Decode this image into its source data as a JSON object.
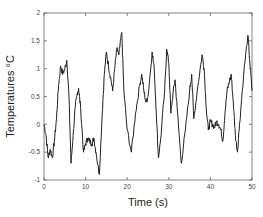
{
  "chart_data": {
    "type": "line",
    "title": "",
    "xlabel": "Time (s)",
    "ylabel": "Temperatures °C",
    "xlim": [
      0,
      50
    ],
    "ylim": [
      -1,
      2
    ],
    "xticks": [
      0,
      10,
      20,
      30,
      40,
      50
    ],
    "yticks": [
      -1,
      -0.5,
      0,
      0.5,
      1,
      1.5,
      2
    ],
    "xtick_labels": [
      "0",
      "10",
      "20",
      "30",
      "40",
      "50"
    ],
    "ytick_labels": [
      "-1",
      "-0.5",
      "0",
      "0.5",
      "1",
      "1.5",
      "2"
    ],
    "grid": false,
    "legend": null,
    "series": [
      {
        "name": "temperature",
        "color": "#222222",
        "x": [
          0,
          0.5,
          1,
          1.5,
          2,
          2.5,
          3,
          3.5,
          4,
          4.5,
          5,
          5.5,
          6,
          6.5,
          7,
          7.5,
          8,
          8.3,
          8.8,
          9.5,
          10,
          10.5,
          11,
          11.5,
          12,
          12.5,
          13.3,
          14,
          14.5,
          15,
          15.5,
          16,
          16.5,
          17,
          17.5,
          18,
          18.7,
          19.2,
          20,
          21,
          22,
          23,
          23.5,
          24,
          24.5,
          25,
          26,
          26.5,
          27,
          27.5,
          28,
          29,
          29.5,
          30,
          30.5,
          31,
          31.5,
          32,
          33,
          34,
          35,
          35.5,
          36,
          37,
          38,
          38.5,
          39,
          39.5,
          40,
          40.5,
          41,
          41.5,
          42,
          42.5,
          43,
          43.5,
          44,
          44.5,
          45,
          45.5,
          46,
          46.5,
          47,
          48,
          49,
          49.5,
          50
        ],
        "values": [
          0.0,
          -0.2,
          -0.6,
          -0.45,
          -0.6,
          -0.3,
          0.1,
          0.7,
          1.05,
          0.9,
          1.0,
          1.15,
          0.5,
          -0.7,
          -0.2,
          0.3,
          0.55,
          0.65,
          0.3,
          -0.5,
          -0.35,
          -0.25,
          -0.3,
          -0.35,
          -0.25,
          -0.5,
          -0.9,
          0.2,
          0.9,
          1.3,
          1.05,
          0.85,
          0.6,
          1.0,
          1.35,
          1.25,
          1.65,
          0.6,
          -0.1,
          -0.5,
          0.2,
          0.7,
          0.9,
          0.6,
          0.4,
          0.5,
          1.3,
          1.0,
          0.2,
          -0.6,
          -0.3,
          0.6,
          1.35,
          1.1,
          0.2,
          0.55,
          0.8,
          0.3,
          -0.7,
          -0.1,
          0.6,
          0.9,
          0.1,
          0.7,
          1.25,
          1.0,
          0.3,
          -0.1,
          0.05,
          0.0,
          -0.05,
          0.05,
          0.0,
          -0.1,
          -0.3,
          0.2,
          0.6,
          0.75,
          0.9,
          0.4,
          -0.2,
          -0.5,
          0.0,
          0.9,
          1.6,
          1.1,
          0.6
        ]
      }
    ]
  }
}
